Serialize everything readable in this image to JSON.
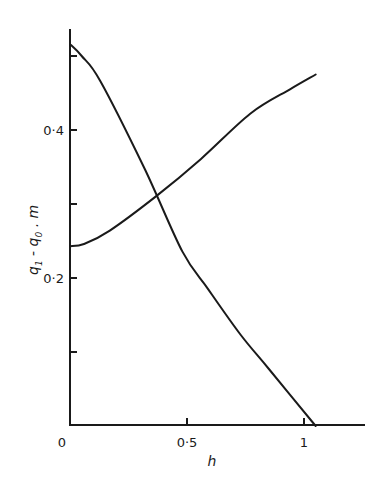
{
  "chart_data": {
    "type": "line",
    "title": "",
    "xlabel": "h",
    "ylabel": "q1 - q0 . m",
    "xlim": [
      0,
      1.2
    ],
    "ylim": [
      0,
      0.54
    ],
    "grid": false,
    "legend": null,
    "x_ticks": [
      {
        "value": 0,
        "label": "0"
      },
      {
        "value": 0.5,
        "label": "0·5"
      },
      {
        "value": 1,
        "label": "1"
      }
    ],
    "y_ticks": [
      {
        "value": 0.1,
        "label": ""
      },
      {
        "value": 0.2,
        "label": "0·2"
      },
      {
        "value": 0.3,
        "label": ""
      },
      {
        "value": 0.4,
        "label": "0·4"
      },
      {
        "value": 0.5,
        "label": ""
      }
    ],
    "series": [
      {
        "name": "decreasing curve",
        "x": [
          0.0,
          0.05,
          0.13,
          0.32,
          0.48,
          0.59,
          0.73,
          0.85,
          1.05
        ],
        "y": [
          0.516,
          0.5,
          0.466,
          0.347,
          0.236,
          0.185,
          0.123,
          0.077,
          0.0
        ]
      },
      {
        "name": "increasing curve",
        "x": [
          0.0,
          0.06,
          0.17,
          0.37,
          0.56,
          0.77,
          0.94,
          1.05
        ],
        "y": [
          0.243,
          0.246,
          0.264,
          0.311,
          0.361,
          0.422,
          0.455,
          0.475
        ]
      }
    ]
  },
  "axes": {
    "x_label": "h",
    "y_label_main": "q",
    "y_label_sub1": "1",
    "y_label_mid": " - q",
    "y_label_sub0": "0",
    "y_label_tail": " . m",
    "origin_label": "0"
  },
  "colors": {
    "line": "#1a1a1a",
    "background": "#ffffff"
  }
}
